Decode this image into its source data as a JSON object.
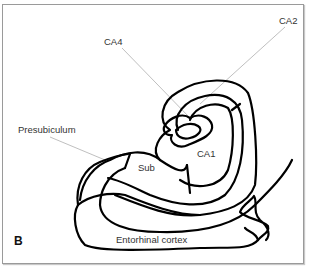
{
  "figure": {
    "panel_label": "B",
    "labels": {
      "ca2": "CA2",
      "ca4": "CA4",
      "ca1": "CA1",
      "presubiculum": "Presubiculum",
      "subiculum": "Sub",
      "entorhinal": "Entorhinal cortex"
    },
    "colors": {
      "outline": "#000000",
      "pointer": "#b8b8b8",
      "label_text": "#333333",
      "frame_border": "#9a9a9a"
    }
  }
}
